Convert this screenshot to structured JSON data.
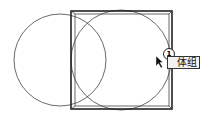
{
  "drawing": {
    "stroke": "#333333",
    "left_circle": {
      "cx": 60,
      "cy": 60,
      "r": 46
    },
    "right_circle": {
      "cx": 121,
      "cy": 60,
      "r": 50
    },
    "outer_rect": {
      "x": 71,
      "y": 11,
      "w": 101,
      "h": 98
    },
    "inner_rect": {
      "x": 74,
      "y": 14,
      "w": 95,
      "h": 92
    }
  },
  "cursor_tooltip": {
    "badge_number": "1",
    "label": "体组"
  }
}
